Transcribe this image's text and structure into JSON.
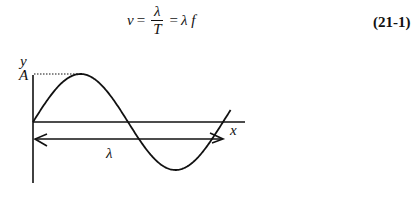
{
  "equation": {
    "lhs": "v",
    "eq1": "=",
    "numerator": "λ",
    "denominator": "T",
    "eq2": "=",
    "rhs": "λ f",
    "number": "(21-1)"
  },
  "figure": {
    "y_axis_label": "y",
    "x_axis_label": "x",
    "amplitude_label": "A",
    "wavelength_label": "λ"
  }
}
